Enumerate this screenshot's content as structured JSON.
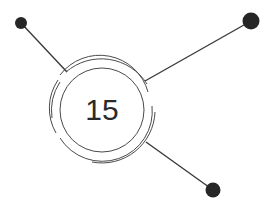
{
  "diagram": {
    "center_label": "15",
    "colors": {
      "line": "#3a3a3a",
      "node": "#262626",
      "text": "#2a2a2a",
      "background": "#ffffff"
    },
    "nodes": [
      {
        "name": "top-left",
        "x": 21,
        "y": 23,
        "r": 6
      },
      {
        "name": "top-right",
        "x": 251,
        "y": 21,
        "r": 8.5
      },
      {
        "name": "bottom-right",
        "x": 213,
        "y": 190,
        "r": 7.5
      }
    ]
  }
}
